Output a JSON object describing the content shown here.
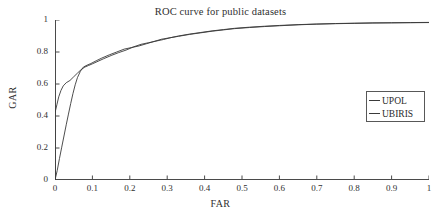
{
  "chart_data": {
    "type": "line",
    "title": "ROC curve for public datasets",
    "xlabel": "FAR",
    "ylabel": "GAR",
    "xlim": [
      0,
      1
    ],
    "ylim": [
      0,
      1
    ],
    "grid": false,
    "legend_position": "right",
    "x_ticks": [
      "0",
      "0.1",
      "0.2",
      "0.3",
      "0.4",
      "0.5",
      "0.6",
      "0.7",
      "0.8",
      "0.9",
      "1"
    ],
    "x_tick_values": [
      0,
      0.1,
      0.2,
      0.3,
      0.4,
      0.5,
      0.6,
      0.7,
      0.8,
      0.9,
      1
    ],
    "y_ticks": [
      "0",
      "0.2",
      "0.4",
      "0.6",
      "0.8",
      "1"
    ],
    "y_tick_values": [
      0,
      0.2,
      0.4,
      0.6,
      0.8,
      1
    ],
    "line_color": "#3a3a3a",
    "series": [
      {
        "name": "UPOL",
        "color": "#3a3a3a",
        "points": [
          [
            0.0,
            0.0
          ],
          [
            0.0,
            0.42
          ],
          [
            0.005,
            0.47
          ],
          [
            0.01,
            0.52
          ],
          [
            0.016,
            0.56
          ],
          [
            0.022,
            0.588
          ],
          [
            0.03,
            0.608
          ],
          [
            0.04,
            0.622
          ],
          [
            0.05,
            0.645
          ],
          [
            0.06,
            0.668
          ],
          [
            0.07,
            0.69
          ],
          [
            0.08,
            0.706
          ],
          [
            0.09,
            0.716
          ],
          [
            0.1,
            0.726
          ],
          [
            0.115,
            0.742
          ],
          [
            0.13,
            0.758
          ],
          [
            0.15,
            0.778
          ],
          [
            0.17,
            0.796
          ],
          [
            0.19,
            0.812
          ],
          [
            0.21,
            0.832
          ],
          [
            0.23,
            0.848
          ],
          [
            0.25,
            0.858
          ],
          [
            0.27,
            0.868
          ],
          [
            0.29,
            0.878
          ],
          [
            0.31,
            0.89
          ],
          [
            0.33,
            0.9
          ],
          [
            0.36,
            0.912
          ],
          [
            0.39,
            0.922
          ],
          [
            0.42,
            0.932
          ],
          [
            0.45,
            0.94
          ],
          [
            0.48,
            0.948
          ],
          [
            0.52,
            0.955
          ],
          [
            0.56,
            0.961
          ],
          [
            0.6,
            0.966
          ],
          [
            0.65,
            0.971
          ],
          [
            0.7,
            0.975
          ],
          [
            0.75,
            0.978
          ],
          [
            0.8,
            0.98
          ],
          [
            0.85,
            0.982
          ],
          [
            0.9,
            0.983
          ],
          [
            0.95,
            0.984
          ],
          [
            1.0,
            0.985
          ]
        ]
      },
      {
        "name": "UBIRIS",
        "color": "#3a3a3a",
        "points": [
          [
            0.0,
            0.0
          ],
          [
            0.006,
            0.06
          ],
          [
            0.012,
            0.135
          ],
          [
            0.018,
            0.205
          ],
          [
            0.024,
            0.275
          ],
          [
            0.03,
            0.345
          ],
          [
            0.036,
            0.412
          ],
          [
            0.042,
            0.478
          ],
          [
            0.048,
            0.54
          ],
          [
            0.054,
            0.595
          ],
          [
            0.06,
            0.64
          ],
          [
            0.068,
            0.68
          ],
          [
            0.076,
            0.706
          ],
          [
            0.086,
            0.718
          ],
          [
            0.096,
            0.728
          ],
          [
            0.11,
            0.745
          ],
          [
            0.125,
            0.762
          ],
          [
            0.145,
            0.782
          ],
          [
            0.165,
            0.8
          ],
          [
            0.185,
            0.818
          ],
          [
            0.205,
            0.828
          ],
          [
            0.225,
            0.838
          ],
          [
            0.245,
            0.852
          ],
          [
            0.265,
            0.866
          ],
          [
            0.285,
            0.88
          ],
          [
            0.305,
            0.888
          ],
          [
            0.33,
            0.898
          ],
          [
            0.36,
            0.91
          ],
          [
            0.39,
            0.92
          ],
          [
            0.42,
            0.93
          ],
          [
            0.45,
            0.938
          ],
          [
            0.48,
            0.946
          ],
          [
            0.52,
            0.953
          ],
          [
            0.56,
            0.959
          ],
          [
            0.6,
            0.964
          ],
          [
            0.65,
            0.97
          ],
          [
            0.7,
            0.974
          ],
          [
            0.75,
            0.977
          ],
          [
            0.8,
            0.979
          ],
          [
            0.85,
            0.981
          ],
          [
            0.9,
            0.982
          ],
          [
            0.95,
            0.983
          ],
          [
            1.0,
            0.984
          ]
        ]
      }
    ]
  },
  "legend": {
    "items": [
      {
        "label": "UPOL"
      },
      {
        "label": "UBIRIS"
      }
    ]
  }
}
